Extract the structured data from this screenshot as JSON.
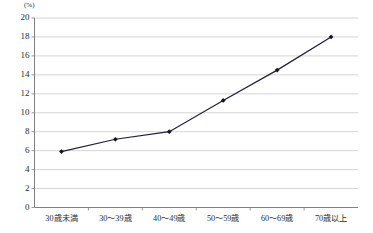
{
  "chart_data": {
    "type": "line",
    "title": "",
    "subtitle": "",
    "xlabel": "",
    "ylabel": "",
    "unit_label": "(%)",
    "categories": [
      "30歳未満",
      "30～39歳",
      "40～49歳",
      "50～59歳",
      "60～69歳",
      "70歳以上"
    ],
    "values": [
      5.9,
      7.2,
      8.0,
      11.3,
      14.5,
      18.0
    ],
    "series": [
      {
        "name": "",
        "values": [
          5.9,
          7.2,
          8.0,
          11.3,
          14.5,
          18.0
        ]
      }
    ],
    "ylim": [
      0,
      20
    ],
    "ytick_step": 2,
    "ytick_labels": [
      "0",
      "2",
      "4",
      "6",
      "8",
      "10",
      "12",
      "14",
      "16",
      "18",
      "20"
    ],
    "grid": true,
    "grid_axis": "y",
    "legend": false,
    "legend_position": "none",
    "marker": "diamond",
    "line_color": "#1f1f35",
    "marker_color": "#15151f",
    "grid_color": "#c9c9c9",
    "axis_color": "#808080",
    "text_color": "#2b2b2b",
    "background": "#ffffff"
  }
}
